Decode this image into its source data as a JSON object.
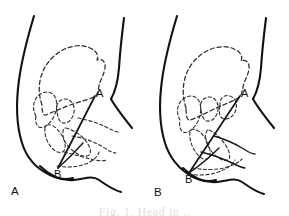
{
  "figure": {
    "type": "line-diagram",
    "background_color": "#ffffff",
    "ink_color": "#121212",
    "caption": "Fig. 1. Head in .."
  },
  "panels": [
    {
      "id": "panel-a",
      "panel_label": "A",
      "points": [
        {
          "id": "point-a",
          "label": "A",
          "x": 97,
          "y": 93
        },
        {
          "id": "point-b",
          "label": "B",
          "x": 57,
          "y": 171
        }
      ],
      "diameter": {
        "from": "A",
        "to": "B"
      }
    },
    {
      "id": "panel-b",
      "panel_label": "B",
      "points": [
        {
          "id": "point-a",
          "label": "A",
          "x": 242,
          "y": 93
        },
        {
          "id": "point-b",
          "label": "B",
          "x": 188,
          "y": 176
        }
      ],
      "diameter": {
        "from": "A",
        "to": "B"
      }
    }
  ],
  "legend": {
    "solid_meaning": "maternal outline",
    "dashed_meaning": "fetal head and pelvic bones"
  }
}
